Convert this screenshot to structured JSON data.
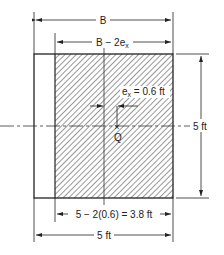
{
  "diagram": {
    "type": "footing-effective-width",
    "labels": {
      "top_dim": "B",
      "effective_dim_base": "B − 2e",
      "effective_dim_sub": "x",
      "eccentricity_base": "e",
      "eccentricity_sub": "x",
      "eccentricity_value": " = 0.6 ft",
      "point": "Q",
      "right_dim": "5 ft",
      "bottom_effective_dim": "5 − 2(0.6) = 3.8 ft",
      "bottom_dim": "5 ft"
    },
    "colors": {
      "line": "#222222",
      "hatch": "#444444",
      "background": "#ffffff"
    }
  }
}
